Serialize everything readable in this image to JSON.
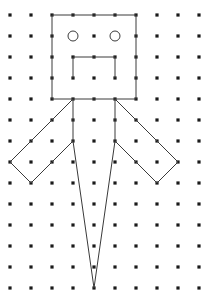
{
  "figure": {
    "background_color": "#ffffff",
    "line_color": "#3a3a3a",
    "dot_color": "#1a1a1a",
    "line_width": 1,
    "dot_radius": 1.6
  },
  "grid": {
    "columns": 10,
    "rows": 14,
    "origin_x": 10,
    "origin_y": 15,
    "spacing_x": 21,
    "spacing_y": 21,
    "dot_shape": "square-dot",
    "omitted_dots": [
      {
        "col": 3,
        "row": 1
      },
      {
        "col": 5,
        "row": 1
      }
    ]
  },
  "chart_data": {
    "type": "scatter",
    "xlabel": "",
    "ylabel": "",
    "xlim": [
      0,
      9
    ],
    "ylim": [
      0,
      13
    ],
    "grid": true,
    "legend": "none",
    "shapes": [
      {
        "name": "head",
        "kind": "polygon",
        "closed": true,
        "points_grid": [
          [
            2,
            0
          ],
          [
            6,
            0
          ],
          [
            6,
            4
          ],
          [
            2,
            4
          ]
        ],
        "points_px": [
          [
            52,
            15
          ],
          [
            136,
            15
          ],
          [
            136,
            99
          ],
          [
            52,
            99
          ]
        ]
      },
      {
        "name": "mouth",
        "kind": "polyline",
        "closed": false,
        "points_grid": [
          [
            3,
            3
          ],
          [
            3,
            2
          ],
          [
            5,
            2
          ],
          [
            5,
            3
          ]
        ],
        "points_px": [
          [
            73,
            78
          ],
          [
            73,
            57
          ],
          [
            115,
            57
          ],
          [
            115,
            78
          ]
        ]
      },
      {
        "name": "left-eye",
        "kind": "circle",
        "center_grid": [
          3,
          1
        ],
        "center_px": [
          73,
          36
        ],
        "radius_px": 5
      },
      {
        "name": "right-eye",
        "kind": "circle",
        "center_grid": [
          5,
          1
        ],
        "center_px": [
          115,
          36
        ],
        "radius_px": 5
      },
      {
        "name": "left-arm",
        "kind": "polygon",
        "closed": true,
        "points_grid": [
          [
            3,
            4
          ],
          [
            1,
            6
          ],
          [
            0,
            7
          ],
          [
            1,
            8
          ],
          [
            3,
            6
          ]
        ],
        "points_px": [
          [
            73,
            99
          ],
          [
            31,
            141
          ],
          [
            10,
            162
          ],
          [
            31,
            183
          ],
          [
            73,
            141
          ]
        ]
      },
      {
        "name": "right-arm",
        "kind": "polygon",
        "closed": true,
        "points_grid": [
          [
            5,
            4
          ],
          [
            7,
            6
          ],
          [
            8,
            7
          ],
          [
            7,
            8
          ],
          [
            5,
            6
          ]
        ],
        "points_px": [
          [
            115,
            99
          ],
          [
            157,
            141
          ],
          [
            178,
            162
          ],
          [
            157,
            183
          ],
          [
            115,
            141
          ]
        ]
      },
      {
        "name": "legs",
        "kind": "polyline",
        "closed": false,
        "points_grid": [
          [
            3,
            6
          ],
          [
            4,
            13
          ],
          [
            5,
            6
          ]
        ],
        "points_px": [
          [
            73,
            141
          ],
          [
            94,
            288
          ],
          [
            115,
            141
          ]
        ]
      }
    ]
  },
  "annotations": {
    "head_label": "head",
    "eyes_label": "eyes",
    "mouth_label": "mouth",
    "left_arm_label": "left arm",
    "right_arm_label": "right arm",
    "legs_label": "legs"
  }
}
